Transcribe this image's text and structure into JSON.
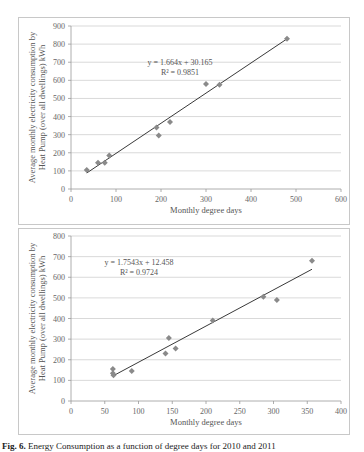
{
  "chart_data": [
    {
      "type": "scatter",
      "title": "",
      "xlabel": "Monthly degree days",
      "ylabel": "Average monthly electricity consumption by Heat Pump (over all dwellings) kWh",
      "xlim": [
        0,
        600
      ],
      "ylim": [
        0,
        900
      ],
      "xticks": [
        0,
        100,
        200,
        300,
        400,
        500,
        600
      ],
      "yticks": [
        0,
        100,
        200,
        300,
        400,
        500,
        600,
        700,
        800,
        900
      ],
      "grid": "horizontal",
      "legend": "none",
      "points": [
        [
          35,
          105
        ],
        [
          60,
          145
        ],
        [
          75,
          145
        ],
        [
          85,
          185
        ],
        [
          190,
          340
        ],
        [
          195,
          295
        ],
        [
          220,
          370
        ],
        [
          300,
          580
        ],
        [
          330,
          575
        ],
        [
          480,
          830
        ]
      ],
      "trendline": {
        "slope": 1.664,
        "intercept": 30.165,
        "x_range": [
          35,
          480
        ]
      },
      "equation": "y = 1.664x + 30.165",
      "r_squared": "R² = 0.9851"
    },
    {
      "type": "scatter",
      "title": "",
      "xlabel": "Monthly degree days",
      "ylabel": "Average monthly electricity consumption by Heat Pump (over all dwellings) kWh",
      "xlim": [
        0,
        400
      ],
      "ylim": [
        0,
        800
      ],
      "xticks": [
        0,
        50,
        100,
        150,
        200,
        250,
        300,
        350,
        400
      ],
      "yticks": [
        0,
        100,
        200,
        300,
        400,
        500,
        600,
        700,
        800
      ],
      "grid": "horizontal",
      "legend": "none",
      "points": [
        [
          62,
          155
        ],
        [
          62,
          135
        ],
        [
          63,
          125
        ],
        [
          90,
          145
        ],
        [
          140,
          230
        ],
        [
          145,
          305
        ],
        [
          155,
          255
        ],
        [
          210,
          390
        ],
        [
          285,
          505
        ],
        [
          305,
          490
        ],
        [
          357,
          680
        ]
      ],
      "trendline": {
        "slope": 1.7543,
        "intercept": 12.458,
        "x_range": [
          63,
          357
        ]
      },
      "equation": "y = 1.7543x + 12.458",
      "r_squared": "R² = 0.9724"
    }
  ],
  "caption": {
    "label": "Fig. 6.",
    "text": "Energy Consumption as a function of degree days for 2010 and 2011"
  },
  "colors": {
    "marker": "#8a8a8a",
    "trendline": "#222222",
    "grid": "#cfcfcf",
    "frame": "#c8c8c8"
  }
}
